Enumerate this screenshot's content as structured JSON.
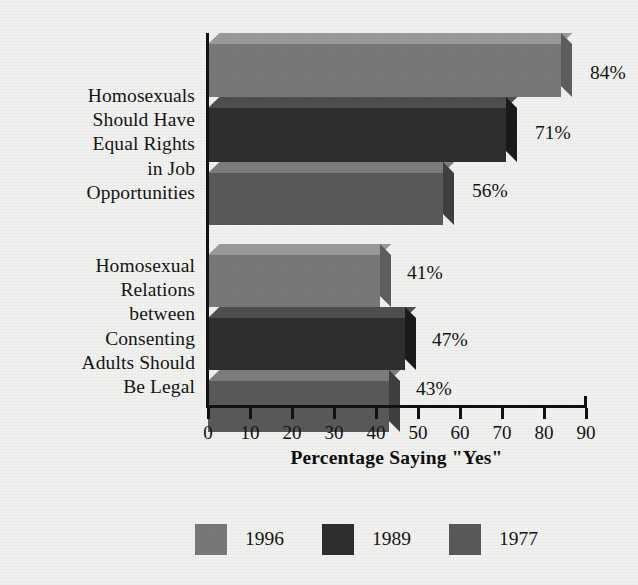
{
  "chart_data": {
    "type": "bar",
    "orientation": "horizontal",
    "style": "3d",
    "title": "",
    "xlabel": "Percentage Saying \"Yes\"",
    "ylabel": "",
    "xlim": [
      0,
      90
    ],
    "xticks": [
      0,
      10,
      20,
      30,
      40,
      50,
      60,
      70,
      80,
      90
    ],
    "xtick_labels": [
      "0",
      "10",
      "20",
      "30",
      "40",
      "50",
      "60",
      "70",
      "80",
      "90"
    ],
    "grid": false,
    "legend_position": "bottom",
    "categories": [
      "Homosexuals Should Have Equal Rights in Job Opportunities",
      "Homosexual Relations between Consenting Adults Should Be Legal"
    ],
    "category_label_lines": [
      [
        "Homosexuals",
        "Should Have",
        "Equal Rights",
        "in Job",
        "Opportunities"
      ],
      [
        "Homosexual",
        "Relations",
        "between",
        "Consenting",
        "Adults Should",
        "Be Legal"
      ]
    ],
    "series": [
      {
        "name": "1996",
        "values": [
          84,
          41
        ],
        "color": "#787878"
      },
      {
        "name": "1989",
        "values": [
          71,
          47
        ],
        "color": "#2e2e2e"
      },
      {
        "name": "1977",
        "values": [
          56,
          43
        ],
        "color": "#595959"
      }
    ],
    "value_labels": [
      "84%",
      "71%",
      "56%",
      "41%",
      "47%",
      "43%"
    ],
    "bars": [
      {
        "series": "1996",
        "category": 0,
        "value": 84,
        "label": "84%",
        "color": "#787878",
        "top_color": "#9a9a9a",
        "side_color": "#5e5e5e"
      },
      {
        "series": "1989",
        "category": 0,
        "value": 71,
        "label": "71%",
        "color": "#2e2e2e",
        "top_color": "#4e4e4e",
        "side_color": "#1a1a1a"
      },
      {
        "series": "1977",
        "category": 0,
        "value": 56,
        "label": "56%",
        "color": "#595959",
        "top_color": "#7d7d7d",
        "side_color": "#3f3f3f"
      },
      {
        "series": "1996",
        "category": 1,
        "value": 41,
        "label": "41%",
        "color": "#787878",
        "top_color": "#9a9a9a",
        "side_color": "#5e5e5e"
      },
      {
        "series": "1989",
        "category": 1,
        "value": 47,
        "label": "47%",
        "color": "#2e2e2e",
        "top_color": "#4e4e4e",
        "side_color": "#1a1a1a"
      },
      {
        "series": "1977",
        "category": 1,
        "value": 43,
        "label": "43%",
        "color": "#595959",
        "top_color": "#7d7d7d",
        "side_color": "#3f3f3f"
      }
    ]
  },
  "legend": {
    "items": [
      {
        "label": "1996",
        "color": "#787878"
      },
      {
        "label": "1989",
        "color": "#2e2e2e"
      },
      {
        "label": "1977",
        "color": "#595959"
      }
    ]
  },
  "colors": {
    "background": "#f1f1ef",
    "axis": "#111111",
    "text": "#131313"
  }
}
